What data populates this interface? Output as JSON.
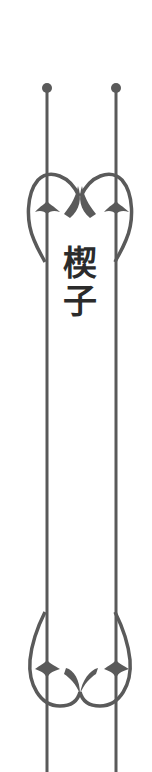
{
  "title": {
    "chars": [
      "楔",
      "子"
    ],
    "text": "楔子"
  },
  "ornament": {
    "icon": "vertical-scroll-ornament-icon",
    "color": "#5a5a5a"
  },
  "colors": {
    "background": "#ffffff",
    "text": "#2b2b2b",
    "line": "#5a5a5a"
  }
}
